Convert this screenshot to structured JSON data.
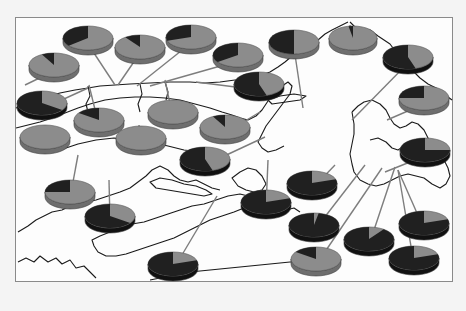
{
  "map": {
    "frame": {
      "x": 15,
      "y": 17,
      "w": 438,
      "h": 265
    },
    "colors": {
      "background": "#f4f4f4",
      "frame_fill": "#fdfdfd",
      "frame_border": "#8a8a8a",
      "coastline": "#1a1a1a",
      "leader_line": "#7d7d7d",
      "pie_light": "#8c8c8c",
      "pie_light_side": "#6e6e6e",
      "pie_dark": "#202020",
      "pie_dark_side": "#111111"
    }
  },
  "chart_data": {
    "type": "pie",
    "title": "",
    "legend": [],
    "pies": [
      {
        "id": 1,
        "cx": 88,
        "cy": 38,
        "rx": 25,
        "ry": 12,
        "dark": 0.36,
        "anchor": [
          115,
          85
        ]
      },
      {
        "id": 2,
        "cx": 140,
        "cy": 47,
        "rx": 25,
        "ry": 12,
        "dark": 0.1,
        "anchor": [
          118,
          85
        ]
      },
      {
        "id": 3,
        "cx": 191,
        "cy": 37,
        "rx": 25,
        "ry": 12,
        "dark": 0.3,
        "anchor": [
          137,
          86
        ]
      },
      {
        "id": 4,
        "cx": 238,
        "cy": 55,
        "rx": 25,
        "ry": 12,
        "dark": 0.35,
        "anchor": [
          150,
          86
        ]
      },
      {
        "id": 5,
        "cx": 294,
        "cy": 42,
        "rx": 25,
        "ry": 12,
        "dark": 0.5,
        "anchor": [
          303,
          108
        ]
      },
      {
        "id": 6,
        "cx": 353,
        "cy": 38,
        "rx": 24,
        "ry": 12,
        "dark": 0.03,
        "anchor": [
          350,
          25
        ]
      },
      {
        "id": 7,
        "cx": 408,
        "cy": 57,
        "rx": 25,
        "ry": 12,
        "dark": 0.55,
        "anchor": [
          352,
          120
        ]
      },
      {
        "id": 8,
        "cx": 54,
        "cy": 65,
        "rx": 25,
        "ry": 12,
        "dark": 0.08,
        "anchor": [
          25,
          85
        ]
      },
      {
        "id": 9,
        "cx": 42,
        "cy": 103,
        "rx": 25,
        "ry": 12,
        "dark": 0.65,
        "anchor": [
          88,
          88
        ]
      },
      {
        "id": 10,
        "cx": 99,
        "cy": 120,
        "rx": 25,
        "ry": 12,
        "dark": 0.15,
        "anchor": [
          89,
          85
        ]
      },
      {
        "id": 11,
        "cx": 173,
        "cy": 112,
        "rx": 25,
        "ry": 12,
        "dark": 0.0,
        "anchor": [
          165,
          80
        ]
      },
      {
        "id": 12,
        "cx": 259,
        "cy": 84,
        "rx": 25,
        "ry": 12,
        "dark": 0.55,
        "anchor": [
          196,
          82
        ]
      },
      {
        "id": 13,
        "cx": 225,
        "cy": 127,
        "rx": 25,
        "ry": 12,
        "dark": 0.08,
        "anchor": [
          260,
          112
        ]
      },
      {
        "id": 14,
        "cx": 424,
        "cy": 98,
        "rx": 25,
        "ry": 12,
        "dark": 0.25,
        "anchor": [
          387,
          120
        ]
      },
      {
        "id": 15,
        "cx": 45,
        "cy": 137,
        "rx": 25,
        "ry": 12,
        "dark": 0.0,
        "anchor": [
          45,
          125
        ]
      },
      {
        "id": 16,
        "cx": 141,
        "cy": 138,
        "rx": 25,
        "ry": 12,
        "dark": 0.0,
        "anchor": [
          139,
          125
        ]
      },
      {
        "id": 17,
        "cx": 205,
        "cy": 159,
        "rx": 25,
        "ry": 12,
        "dark": 0.55,
        "anchor": [
          265,
          137
        ]
      },
      {
        "id": 18,
        "cx": 425,
        "cy": 150,
        "rx": 25,
        "ry": 12,
        "dark": 0.75,
        "anchor": [
          385,
          172
        ]
      },
      {
        "id": 19,
        "cx": 70,
        "cy": 192,
        "rx": 25,
        "ry": 12,
        "dark": 0.25,
        "anchor": [
          78,
          155
        ]
      },
      {
        "id": 20,
        "cx": 110,
        "cy": 216,
        "rx": 25,
        "ry": 12,
        "dark": 0.65,
        "anchor": [
          109,
          180
        ]
      },
      {
        "id": 21,
        "cx": 266,
        "cy": 202,
        "rx": 25,
        "ry": 12,
        "dark": 0.8,
        "anchor": [
          268,
          160
        ]
      },
      {
        "id": 22,
        "cx": 312,
        "cy": 183,
        "rx": 25,
        "ry": 12,
        "dark": 0.8,
        "anchor": [
          335,
          165
        ]
      },
      {
        "id": 23,
        "cx": 314,
        "cy": 225,
        "rx": 25,
        "ry": 12,
        "dark": 0.97,
        "anchor": [
          365,
          165
        ]
      },
      {
        "id": 24,
        "cx": 369,
        "cy": 239,
        "rx": 25,
        "ry": 12,
        "dark": 0.9,
        "anchor": [
          395,
          167
        ]
      },
      {
        "id": 25,
        "cx": 424,
        "cy": 223,
        "rx": 25,
        "ry": 12,
        "dark": 0.8,
        "anchor": [
          398,
          170
        ]
      },
      {
        "id": 26,
        "cx": 414,
        "cy": 258,
        "rx": 25,
        "ry": 12,
        "dark": 0.8,
        "anchor": [
          398,
          170
        ]
      },
      {
        "id": 27,
        "cx": 173,
        "cy": 264,
        "rx": 25,
        "ry": 12,
        "dark": 0.8,
        "anchor": [
          217,
          196
        ]
      },
      {
        "id": 28,
        "cx": 316,
        "cy": 259,
        "rx": 25,
        "ry": 12,
        "dark": 0.15,
        "anchor": [
          382,
          168
        ]
      }
    ]
  }
}
